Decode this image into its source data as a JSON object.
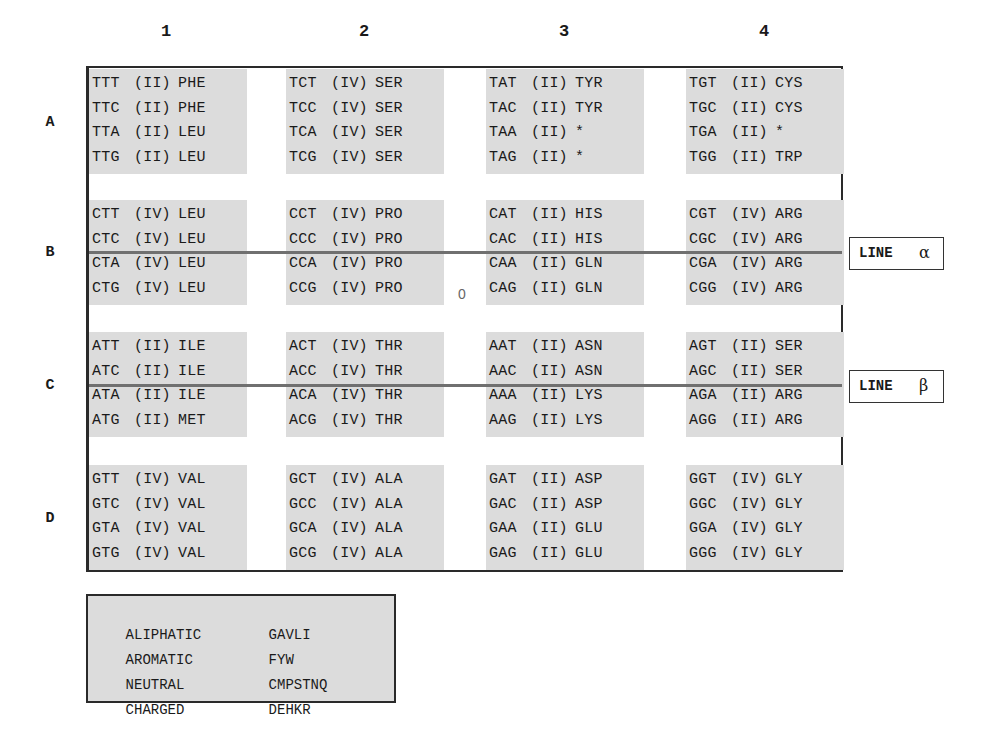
{
  "column_headers": [
    "1",
    "2",
    "3",
    "4"
  ],
  "row_headers": [
    "A",
    "B",
    "C",
    "D"
  ],
  "center_marker": "0",
  "lines": [
    {
      "label": "LINE",
      "symbol": "α"
    },
    {
      "label": "LINE",
      "symbol": "β"
    }
  ],
  "grid": {
    "A": [
      [
        [
          "TTT",
          "(II)",
          "PHE"
        ],
        [
          "TTC",
          "(II)",
          "PHE"
        ],
        [
          "TTA",
          "(II)",
          "LEU"
        ],
        [
          "TTG",
          "(II)",
          "LEU"
        ]
      ],
      [
        [
          "TCT",
          "(IV)",
          "SER"
        ],
        [
          "TCC",
          "(IV)",
          "SER"
        ],
        [
          "TCA",
          "(IV)",
          "SER"
        ],
        [
          "TCG",
          "(IV)",
          "SER"
        ]
      ],
      [
        [
          "TAT",
          "(II)",
          "TYR"
        ],
        [
          "TAC",
          "(II)",
          "TYR"
        ],
        [
          "TAA",
          "(II)",
          "*"
        ],
        [
          "TAG",
          "(II)",
          "*"
        ]
      ],
      [
        [
          "TGT",
          "(II)",
          "CYS"
        ],
        [
          "TGC",
          "(II)",
          "CYS"
        ],
        [
          "TGA",
          "(II)",
          "*"
        ],
        [
          "TGG",
          "(II)",
          "TRP"
        ]
      ]
    ],
    "B": [
      [
        [
          "CTT",
          "(IV)",
          "LEU"
        ],
        [
          "CTC",
          "(IV)",
          "LEU"
        ],
        [
          "CTA",
          "(IV)",
          "LEU"
        ],
        [
          "CTG",
          "(IV)",
          "LEU"
        ]
      ],
      [
        [
          "CCT",
          "(IV)",
          "PRO"
        ],
        [
          "CCC",
          "(IV)",
          "PRO"
        ],
        [
          "CCA",
          "(IV)",
          "PRO"
        ],
        [
          "CCG",
          "(IV)",
          "PRO"
        ]
      ],
      [
        [
          "CAT",
          "(II)",
          "HIS"
        ],
        [
          "CAC",
          "(II)",
          "HIS"
        ],
        [
          "CAA",
          "(II)",
          "GLN"
        ],
        [
          "CAG",
          "(II)",
          "GLN"
        ]
      ],
      [
        [
          "CGT",
          "(IV)",
          "ARG"
        ],
        [
          "CGC",
          "(IV)",
          "ARG"
        ],
        [
          "CGA",
          "(IV)",
          "ARG"
        ],
        [
          "CGG",
          "(IV)",
          "ARG"
        ]
      ]
    ],
    "C": [
      [
        [
          "ATT",
          "(II)",
          "ILE"
        ],
        [
          "ATC",
          "(II)",
          "ILE"
        ],
        [
          "ATA",
          "(II)",
          "ILE"
        ],
        [
          "ATG",
          "(II)",
          "MET"
        ]
      ],
      [
        [
          "ACT",
          "(IV)",
          "THR"
        ],
        [
          "ACC",
          "(IV)",
          "THR"
        ],
        [
          "ACA",
          "(IV)",
          "THR"
        ],
        [
          "ACG",
          "(IV)",
          "THR"
        ]
      ],
      [
        [
          "AAT",
          "(II)",
          "ASN"
        ],
        [
          "AAC",
          "(II)",
          "ASN"
        ],
        [
          "AAA",
          "(II)",
          "LYS"
        ],
        [
          "AAG",
          "(II)",
          "LYS"
        ]
      ],
      [
        [
          "AGT",
          "(II)",
          "SER"
        ],
        [
          "AGC",
          "(II)",
          "SER"
        ],
        [
          "AGA",
          "(II)",
          "ARG"
        ],
        [
          "AGG",
          "(II)",
          "ARG"
        ]
      ]
    ],
    "D": [
      [
        [
          "GTT",
          "(IV)",
          "VAL"
        ],
        [
          "GTC",
          "(IV)",
          "VAL"
        ],
        [
          "GTA",
          "(IV)",
          "VAL"
        ],
        [
          "GTG",
          "(IV)",
          "VAL"
        ]
      ],
      [
        [
          "GCT",
          "(IV)",
          "ALA"
        ],
        [
          "GCC",
          "(IV)",
          "ALA"
        ],
        [
          "GCA",
          "(IV)",
          "ALA"
        ],
        [
          "GCG",
          "(IV)",
          "ALA"
        ]
      ],
      [
        [
          "GAT",
          "(II)",
          "ASP"
        ],
        [
          "GAC",
          "(II)",
          "ASP"
        ],
        [
          "GAA",
          "(II)",
          "GLU"
        ],
        [
          "GAG",
          "(II)",
          "GLU"
        ]
      ],
      [
        [
          "GGT",
          "(IV)",
          "GLY"
        ],
        [
          "GGC",
          "(IV)",
          "GLY"
        ],
        [
          "GGA",
          "(IV)",
          "GLY"
        ],
        [
          "GGG",
          "(IV)",
          "GLY"
        ]
      ]
    ]
  },
  "legend": [
    {
      "name": "ALIPHATIC",
      "letters": "GAVLI"
    },
    {
      "name": "AROMATIC",
      "letters": "FYW"
    },
    {
      "name": "NEUTRAL",
      "letters": "CMPSTNQ"
    },
    {
      "name": "CHARGED",
      "letters": "DEHKR"
    }
  ],
  "colors": {
    "cell_background": "#dcdcdc",
    "border": "#2a2a2a",
    "divider_line": "#707070"
  }
}
